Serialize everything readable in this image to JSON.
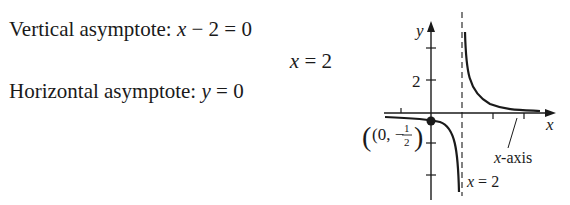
{
  "text": {
    "vertical_label": "Vertical asymptote:",
    "vertical_eq_lhs_var": "x",
    "vertical_eq_rest": " − 2 = 0",
    "vertical_solution_var": "x",
    "vertical_solution_rest": " = 2",
    "horizontal_label": "Horizontal asymptote:",
    "horizontal_eq_var": "y",
    "horizontal_eq_rest": " = 0"
  },
  "graph": {
    "y_axis_label": "y",
    "x_axis_label": "x",
    "y_tick_label": "2",
    "point_label_open": "(0, −",
    "point_label_num": "1",
    "point_label_den": "2",
    "point_label_close": ")",
    "x_axis_annotation_var": "x",
    "x_axis_annotation_rest": "-axis",
    "asymptote_annotation_var": "x",
    "asymptote_annotation_rest": " = 2",
    "colors": {
      "ink": "#1a1a1a"
    }
  }
}
